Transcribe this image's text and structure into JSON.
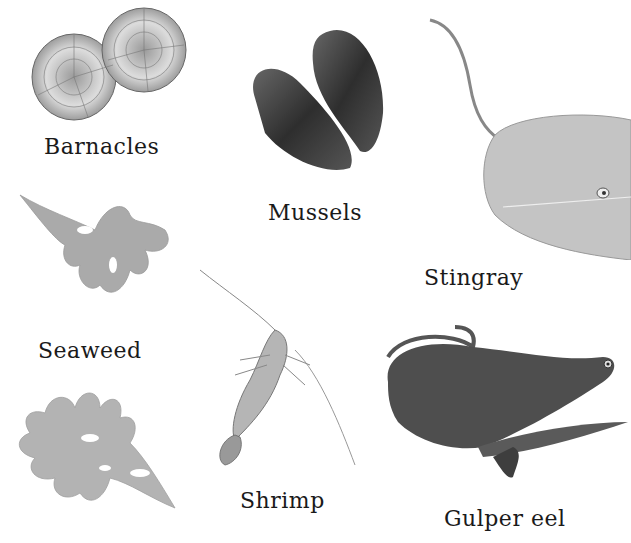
{
  "items": [
    {
      "id": "barnacles",
      "label": "Barnacles"
    },
    {
      "id": "mussels",
      "label": "Mussels"
    },
    {
      "id": "stingray",
      "label": "Stingray"
    },
    {
      "id": "seaweed",
      "label": "Seaweed"
    },
    {
      "id": "shrimp",
      "label": "Shrimp"
    },
    {
      "id": "gulper-eel",
      "label": "Gulper eel"
    }
  ],
  "colors": {
    "background": "#ffffff",
    "text": "#1a1a1a",
    "mussel": "#3d3d3d",
    "stingray": "#bdbdbd",
    "seaweed": "#a9a9a9",
    "eel": "#4a4a4a",
    "barnacle": "#d8d8d8"
  }
}
